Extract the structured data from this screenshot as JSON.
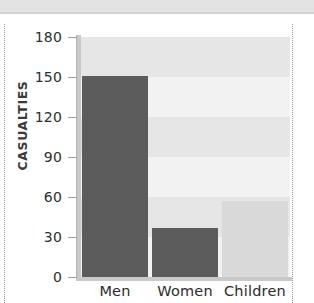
{
  "chart_data": {
    "type": "bar",
    "title": "",
    "subtitle": "",
    "xlabel": "",
    "ylabel": "CASUALTIES",
    "categories": [
      "Men",
      "Women",
      "Children"
    ],
    "values": [
      151,
      37,
      57
    ],
    "series": [
      {
        "name": "Casualties",
        "values": [
          151,
          37,
          57
        ]
      }
    ],
    "ylim": [
      0,
      180
    ],
    "yticks": [
      0,
      30,
      60,
      90,
      120,
      150,
      180
    ],
    "ytick_labels": [
      "0",
      "30",
      "60",
      "90",
      "120",
      "150",
      "180"
    ],
    "grid": true,
    "grid_style": "alternating-horizontal-bands",
    "legend": false,
    "legend_position": "none",
    "bar_colors": [
      "#5c5c5c",
      "#5c5c5c",
      "#d9d9d9"
    ],
    "plot_background": "#f2f2f2",
    "band_color": "#e6e6e6",
    "axis_color": "#c9c9c9",
    "text_color": "#2b2b2b"
  },
  "axis": {
    "y_title": "CASUALTIES",
    "ticks": [
      {
        "label": "180",
        "value": 180
      },
      {
        "label": "150",
        "value": 150
      },
      {
        "label": "120",
        "value": 120
      },
      {
        "label": "90",
        "value": 90
      },
      {
        "label": "60",
        "value": 60
      },
      {
        "label": "30",
        "value": 30
      },
      {
        "label": "0",
        "value": 0
      }
    ]
  },
  "bars": [
    {
      "label": "Men",
      "value": 151,
      "color": "#5c5c5c"
    },
    {
      "label": "Women",
      "value": 37,
      "color": "#5c5c5c"
    },
    {
      "label": "Children",
      "value": 57,
      "color": "#d9d9d9"
    }
  ]
}
